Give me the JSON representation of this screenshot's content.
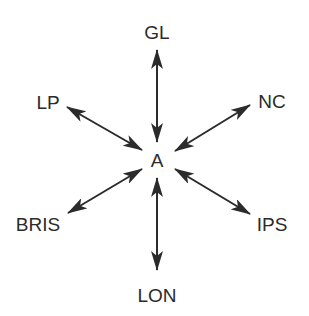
{
  "diagram": {
    "type": "hub-and-spoke",
    "center": {
      "id": "A",
      "label": "A",
      "x": 157,
      "y": 160
    },
    "nodes": [
      {
        "id": "GL",
        "label": "GL",
        "x": 157,
        "y": 32
      },
      {
        "id": "LP",
        "label": "LP",
        "x": 48,
        "y": 102
      },
      {
        "id": "NC",
        "label": "NC",
        "x": 272,
        "y": 101
      },
      {
        "id": "BRIS",
        "label": "BRIS",
        "x": 38,
        "y": 224
      },
      {
        "id": "IPS",
        "label": "IPS",
        "x": 272,
        "y": 224
      },
      {
        "id": "LON",
        "label": "LON",
        "x": 157,
        "y": 295
      }
    ],
    "edges": [
      {
        "from": "A",
        "to": "GL",
        "direction": "bidirectional",
        "x1": 157,
        "y1": 50,
        "x2": 157,
        "y2": 142
      },
      {
        "from": "A",
        "to": "LP",
        "direction": "bidirectional",
        "x1": 67,
        "y1": 107,
        "x2": 142,
        "y2": 150
      },
      {
        "from": "A",
        "to": "NC",
        "direction": "bidirectional",
        "x1": 250,
        "y1": 105,
        "x2": 175,
        "y2": 151
      },
      {
        "from": "A",
        "to": "BRIS",
        "direction": "bidirectional",
        "x1": 68,
        "y1": 213,
        "x2": 142,
        "y2": 169
      },
      {
        "from": "A",
        "to": "IPS",
        "direction": "bidirectional",
        "x1": 175,
        "y1": 169,
        "x2": 250,
        "y2": 214
      },
      {
        "from": "A",
        "to": "LON",
        "direction": "bidirectional",
        "x1": 157,
        "y1": 178,
        "x2": 157,
        "y2": 270
      }
    ],
    "colors": {
      "line": "#2b2b2b",
      "text": "#2b2b2b",
      "background": "#ffffff"
    }
  }
}
